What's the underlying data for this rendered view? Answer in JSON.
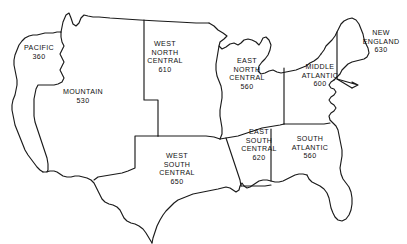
{
  "figure": {
    "background_color": "#ffffff",
    "line_color": "#1a1a1a",
    "text_color": "#111111"
  },
  "regions": [
    {
      "id": "pacific",
      "name": "PACIFIC",
      "lines": [
        "PACIFIC"
      ],
      "code": "360",
      "label_x": 39,
      "label_y": 53
    },
    {
      "id": "mountain",
      "name": "MOUNTAIN",
      "lines": [
        "MOUNTAIN"
      ],
      "code": "530",
      "label_x": 83,
      "label_y": 97
    },
    {
      "id": "west-north-central",
      "name": "WEST NORTH CENTRAL",
      "lines": [
        "WEST",
        "NORTH",
        "CENTRAL"
      ],
      "code": "610",
      "label_x": 165,
      "label_y": 57
    },
    {
      "id": "east-north-central",
      "name": "EAST NORTH CENTRAL",
      "lines": [
        "EAST",
        "NORTH",
        "CENTRAL"
      ],
      "code": "560",
      "label_x": 247,
      "label_y": 74
    },
    {
      "id": "middle-atlantic",
      "name": "MIDDLE ATLANTIC",
      "lines": [
        "MIDDLE",
        "ATLANTIC"
      ],
      "code": "600",
      "label_x": 320,
      "label_y": 76
    },
    {
      "id": "new-england",
      "name": "NEW ENGLAND",
      "lines": [
        "NEW",
        "ENGLAND"
      ],
      "code": "630",
      "label_x": 381,
      "label_y": 42
    },
    {
      "id": "west-south-central",
      "name": "WEST SOUTH CENTRAL",
      "lines": [
        "WEST",
        "SOUTH",
        "CENTRAL"
      ],
      "code": "650",
      "label_x": 177,
      "label_y": 169
    },
    {
      "id": "east-south-central",
      "name": "EAST SOUTH CENTRAL",
      "lines": [
        "EAST",
        "SOUTH",
        "CENTRAL"
      ],
      "code": "620",
      "label_x": 259,
      "label_y": 145
    },
    {
      "id": "south-atlantic",
      "name": "SOUTH ATLANTIC",
      "lines": [
        "SOUTH",
        "ATLANTIC"
      ],
      "code": "560",
      "label_x": 310,
      "label_y": 148
    }
  ]
}
